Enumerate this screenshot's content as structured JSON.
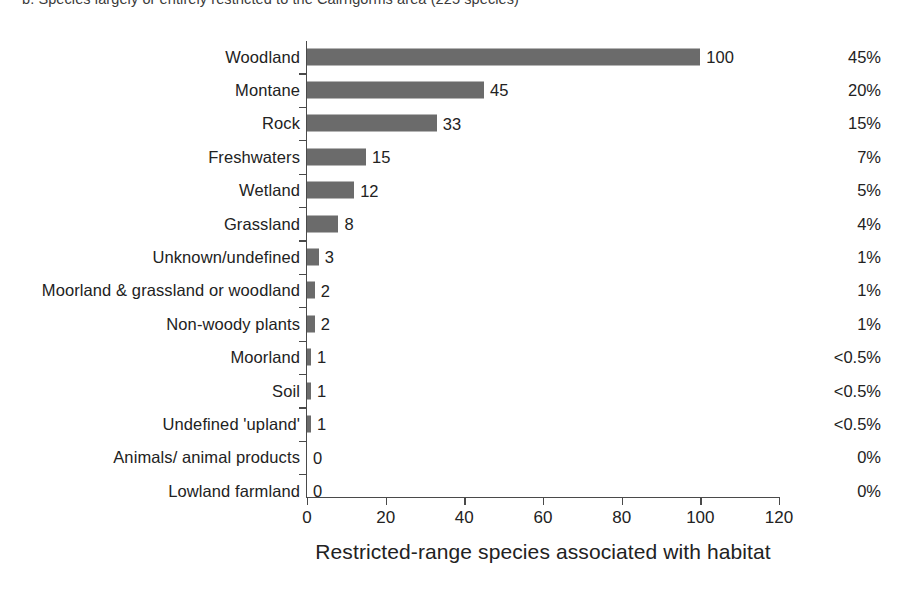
{
  "figure": {
    "caption": "b. Species largely or entirely restricted to the Cairngorms area (225 species)"
  },
  "chart_data": {
    "type": "bar",
    "orientation": "horizontal",
    "title": "b. Species largely or entirely restricted to the Cairngorms area (225 species)",
    "xlabel": "Restricted-range species associated with habitat",
    "ylabel": "",
    "xlim": [
      0,
      120
    ],
    "xticks": [
      0,
      20,
      40,
      60,
      80,
      100,
      120
    ],
    "xtick_labels": [
      "0",
      "20",
      "40",
      "60",
      "80",
      "100",
      "120"
    ],
    "grid": false,
    "legend": null,
    "bar_color": "#6b6b6b",
    "categories": [
      "Woodland",
      "Montane",
      "Rock",
      "Freshwaters",
      "Wetland",
      "Grassland",
      "Unknown/undefined",
      "Moorland & grassland or woodland",
      "Non-woody plants",
      "Moorland",
      "Soil",
      "Undefined 'upland'",
      "Animals/ animal products",
      "Lowland farmland"
    ],
    "values": [
      100,
      45,
      33,
      15,
      12,
      8,
      3,
      2,
      2,
      1,
      1,
      1,
      0,
      0
    ],
    "value_labels": [
      "100",
      "45",
      "33",
      "15",
      "12",
      "8",
      "3",
      "2",
      "2",
      "1",
      "1",
      "1",
      "0",
      "0"
    ],
    "percent_labels": [
      "45%",
      "20%",
      "15%",
      "7%",
      "5%",
      "4%",
      "1%",
      "1%",
      "1%",
      "<0.5%",
      "<0.5%",
      "<0.5%",
      "0%",
      "0%"
    ]
  }
}
